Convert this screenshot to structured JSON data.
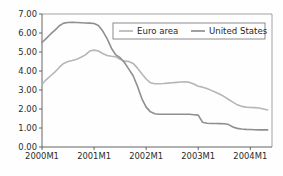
{
  "chart_data": {
    "type": "line",
    "title": "",
    "subtitle": "",
    "xlabel": "",
    "ylabel": "",
    "xlim": [
      0,
      53
    ],
    "ylim": [
      0.0,
      7.0
    ],
    "yticks": [
      "0.00",
      "1.00",
      "2.00",
      "3.00",
      "4.00",
      "5.00",
      "6.00",
      "7.00"
    ],
    "ytick_values": [
      0,
      1,
      2,
      3,
      4,
      5,
      6,
      7
    ],
    "xticks": [
      "2000M1",
      "2001M1",
      "2002M1",
      "2003M1",
      "2004M1"
    ],
    "xtick_values": [
      0,
      12,
      24,
      36,
      48
    ],
    "grid": false,
    "legend_position": "top-right-inside",
    "x": [
      0,
      1,
      2,
      3,
      4,
      5,
      6,
      7,
      8,
      9,
      10,
      11,
      12,
      13,
      14,
      15,
      16,
      17,
      18,
      19,
      20,
      21,
      22,
      23,
      24,
      25,
      26,
      27,
      28,
      29,
      30,
      31,
      32,
      33,
      34,
      35,
      36,
      37,
      38,
      39,
      40,
      41,
      42,
      43,
      44,
      45,
      46,
      47,
      48,
      49,
      50,
      51,
      52
    ],
    "series": [
      {
        "name": "Euro area",
        "color": "#b6b6b6",
        "values": [
          3.3,
          3.55,
          3.75,
          3.95,
          4.2,
          4.4,
          4.5,
          4.55,
          4.62,
          4.72,
          4.85,
          5.05,
          5.1,
          5.05,
          4.92,
          4.82,
          4.78,
          4.75,
          4.62,
          4.52,
          4.5,
          4.4,
          4.15,
          3.85,
          3.58,
          3.38,
          3.33,
          3.33,
          3.34,
          3.36,
          3.38,
          3.4,
          3.42,
          3.43,
          3.4,
          3.32,
          3.2,
          3.15,
          3.08,
          2.98,
          2.88,
          2.78,
          2.65,
          2.5,
          2.36,
          2.22,
          2.14,
          2.1,
          2.08,
          2.07,
          2.05,
          2.0,
          1.95
        ]
      },
      {
        "name": "United States",
        "color": "#8f8f8f",
        "values": [
          5.5,
          5.72,
          5.95,
          6.15,
          6.38,
          6.52,
          6.55,
          6.56,
          6.55,
          6.54,
          6.53,
          6.52,
          6.5,
          6.4,
          6.1,
          5.7,
          5.2,
          4.85,
          4.7,
          4.45,
          4.1,
          3.75,
          3.2,
          2.55,
          2.1,
          1.85,
          1.75,
          1.72,
          1.72,
          1.72,
          1.72,
          1.72,
          1.72,
          1.72,
          1.72,
          1.7,
          1.68,
          1.3,
          1.25,
          1.24,
          1.24,
          1.23,
          1.22,
          1.18,
          1.05,
          0.98,
          0.95,
          0.93,
          0.92,
          0.91,
          0.9,
          0.9,
          0.9
        ]
      }
    ],
    "legend": [
      {
        "label": "Euro area",
        "color": "#b6b6b6"
      },
      {
        "label": "United States",
        "color": "#8f8f8f"
      }
    ]
  },
  "axes": {
    "plot_left": 42,
    "plot_right": 272,
    "plot_top": 14,
    "plot_bottom": 147
  }
}
